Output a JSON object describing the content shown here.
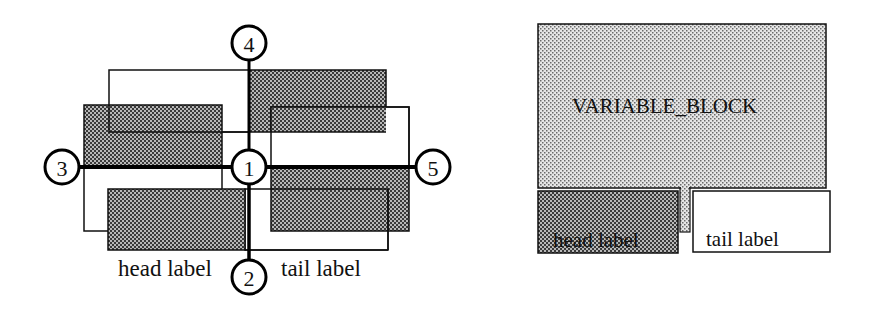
{
  "left_diagram": {
    "nodes": [
      {
        "id": "1",
        "label": "1",
        "cx": 249,
        "cy": 167
      },
      {
        "id": "2",
        "label": "2",
        "cx": 249,
        "cy": 277
      },
      {
        "id": "3",
        "label": "3",
        "cx": 62,
        "cy": 167
      },
      {
        "id": "4",
        "label": "4",
        "cx": 249,
        "cy": 43
      },
      {
        "id": "5",
        "label": "5",
        "cx": 433,
        "cy": 167
      }
    ],
    "head_label": "head label",
    "tail_label": "tail label"
  },
  "right_diagram": {
    "block_label": "VARIABLE_BLOCK",
    "head_label": "head label",
    "tail_label": "tail label"
  },
  "colors": {
    "stroke": "#111111",
    "dark_fill": "#8c8c8c",
    "light_fill": "#cfcfcf",
    "background": "#ffffff"
  }
}
